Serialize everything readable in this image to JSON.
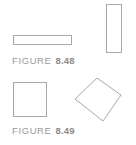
{
  "figures": [
    {
      "label": "FIGURE",
      "number": "8.48",
      "shapes": [
        "horizontal-rectangle",
        "vertical-rectangle"
      ]
    },
    {
      "label": "FIGURE",
      "number": "8.49",
      "shapes": [
        "square",
        "diamond"
      ]
    }
  ],
  "colors": {
    "stroke": "#a8a8a8",
    "caption": "#9a9a9a"
  }
}
